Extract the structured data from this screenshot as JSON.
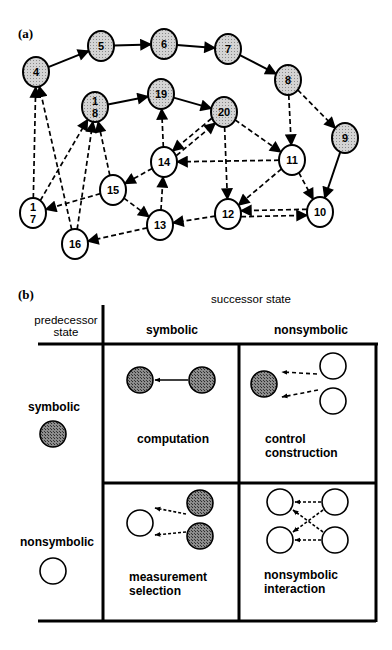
{
  "panel_a": {
    "label": "(a)",
    "nodes": [
      {
        "id": "4",
        "x": 36,
        "y": 72,
        "type": "symbolic"
      },
      {
        "id": "5",
        "x": 101,
        "y": 46,
        "type": "symbolic"
      },
      {
        "id": "6",
        "x": 164,
        "y": 44,
        "type": "symbolic"
      },
      {
        "id": "7",
        "x": 228,
        "y": 49,
        "type": "symbolic"
      },
      {
        "id": "8",
        "x": 288,
        "y": 80,
        "type": "symbolic"
      },
      {
        "id": "9",
        "x": 345,
        "y": 138,
        "type": "symbolic"
      },
      {
        "id": "18",
        "x": 95,
        "y": 107,
        "type": "symbolic",
        "display": "1\n8"
      },
      {
        "id": "19",
        "x": 161,
        "y": 94,
        "type": "symbolic"
      },
      {
        "id": "20",
        "x": 224,
        "y": 112,
        "type": "symbolic"
      },
      {
        "id": "14",
        "x": 164,
        "y": 162,
        "type": "nonsymbolic"
      },
      {
        "id": "15",
        "x": 113,
        "y": 190,
        "type": "nonsymbolic"
      },
      {
        "id": "11",
        "x": 292,
        "y": 160,
        "type": "nonsymbolic"
      },
      {
        "id": "17",
        "x": 33,
        "y": 213,
        "type": "nonsymbolic",
        "display": "1\n7"
      },
      {
        "id": "16",
        "x": 75,
        "y": 244,
        "type": "nonsymbolic"
      },
      {
        "id": "13",
        "x": 160,
        "y": 225,
        "type": "nonsymbolic"
      },
      {
        "id": "12",
        "x": 228,
        "y": 214,
        "type": "nonsymbolic"
      },
      {
        "id": "10",
        "x": 320,
        "y": 212,
        "type": "nonsymbolic"
      }
    ],
    "edges": [
      {
        "from": "4",
        "to": "5",
        "style": "solid"
      },
      {
        "from": "5",
        "to": "6",
        "style": "solid"
      },
      {
        "from": "6",
        "to": "7",
        "style": "solid"
      },
      {
        "from": "7",
        "to": "8",
        "style": "solid"
      },
      {
        "from": "18",
        "to": "19",
        "style": "solid"
      },
      {
        "from": "19",
        "to": "20",
        "style": "solid"
      },
      {
        "from": "9",
        "to": "10",
        "style": "solid"
      },
      {
        "from": "8",
        "to": "9",
        "style": "dashed"
      },
      {
        "from": "8",
        "to": "11",
        "style": "dashed"
      },
      {
        "from": "20",
        "to": "11",
        "style": "dashed"
      },
      {
        "from": "20",
        "to": "12",
        "style": "dashed"
      },
      {
        "from": "20",
        "to": "14",
        "style": "dashed"
      },
      {
        "from": "14",
        "to": "20",
        "style": "dashed"
      },
      {
        "from": "14",
        "to": "19",
        "style": "dashed"
      },
      {
        "from": "14",
        "to": "15",
        "style": "dashed"
      },
      {
        "from": "11",
        "to": "14",
        "style": "dashed"
      },
      {
        "from": "11",
        "to": "12",
        "style": "dashed"
      },
      {
        "from": "11",
        "to": "10",
        "style": "dashed"
      },
      {
        "from": "10",
        "to": "12",
        "style": "dashed"
      },
      {
        "from": "12",
        "to": "10",
        "style": "dashed"
      },
      {
        "from": "12",
        "to": "13",
        "style": "dashed"
      },
      {
        "from": "13",
        "to": "14",
        "style": "dashed"
      },
      {
        "from": "13",
        "to": "16",
        "style": "dashed"
      },
      {
        "from": "15",
        "to": "13",
        "style": "dashed"
      },
      {
        "from": "15",
        "to": "17",
        "style": "dashed"
      },
      {
        "from": "15",
        "to": "18",
        "style": "dashed"
      },
      {
        "from": "17",
        "to": "4",
        "style": "dashed"
      },
      {
        "from": "17",
        "to": "18",
        "style": "dashed"
      },
      {
        "from": "16",
        "to": "4",
        "style": "dashed"
      },
      {
        "from": "16",
        "to": "18",
        "style": "dashed"
      }
    ]
  },
  "panel_b": {
    "label": "(b)",
    "column_axis_title": "successor state",
    "row_axis_title_line1": "predecessor",
    "row_axis_title_line2": "state",
    "columns": [
      "symbolic",
      "nonsymbolic"
    ],
    "rows": [
      "symbolic",
      "nonsymbolic"
    ],
    "cells": {
      "sym_sym": {
        "line1": "computation",
        "line2": ""
      },
      "sym_non": {
        "line1": "control",
        "line2": "construction"
      },
      "non_sym": {
        "line1": "measurement",
        "line2": "selection"
      },
      "non_non": {
        "line1": "nonsymbolic",
        "line2": "interaction"
      }
    }
  },
  "colors": {
    "symbolic_fill_a": "#c8c8c8",
    "symbolic_fill_b": "#7a7a7a",
    "nonsymbolic_fill": "#ffffff",
    "stroke": "#000000"
  }
}
